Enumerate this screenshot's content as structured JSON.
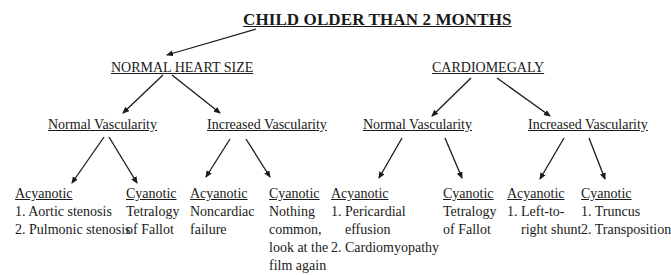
{
  "title": "CHILD OLDER THAN 2 MONTHS",
  "branches": [
    {
      "label": "NORMAL HEART SIZE",
      "children": [
        {
          "label": "Normal Vascularity",
          "leaves": [
            {
              "heading": "Acyanotic",
              "lines": [
                "1.  Aortic stenosis",
                "2.  Pulmonic stenosis"
              ]
            },
            {
              "heading": "Cyanotic",
              "lines": [
                "Tetralogy",
                "of Fallot"
              ]
            }
          ]
        },
        {
          "label": "Increased Vascularity",
          "leaves": [
            {
              "heading": "Acyanotic",
              "lines": [
                "Noncardiac",
                "failure"
              ]
            },
            {
              "heading": "Cyanotic",
              "lines": [
                "Nothing",
                "common,",
                "look at the",
                "film again"
              ]
            }
          ]
        }
      ]
    },
    {
      "label": "CARDIOMEGALY",
      "children": [
        {
          "label": "Normal Vascularity",
          "leaves": [
            {
              "heading": "Acyanotic",
              "lines": [
                "1. Pericardial",
                "effusion",
                "2. Cardiomyopathy"
              ]
            },
            {
              "heading": "Cyanotic",
              "lines": [
                "Tetralogy",
                "of Fallot"
              ]
            }
          ]
        },
        {
          "label": "Increased Vascularity",
          "leaves": [
            {
              "heading": "Acyanotic",
              "lines": [
                "1.  Left-to-",
                "right shunt"
              ]
            },
            {
              "heading": "Cyanotic",
              "lines": [
                "1. Truncus",
                "2. Transposition"
              ]
            }
          ]
        }
      ]
    }
  ],
  "colors": {
    "ink": "#1a1a1a",
    "background": "#ffffff"
  }
}
